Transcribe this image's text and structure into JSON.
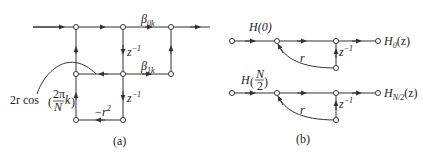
{
  "diagram_a": {
    "caption": "(a)",
    "labels": {
      "beta0": "β",
      "beta0_sub": "0k",
      "beta1": "β",
      "beta1_sub": "1k",
      "zinv1": "z",
      "zinv1_sup": "−1",
      "zinv2": "z",
      "zinv2_sup": "−1",
      "neg_r2": "−r",
      "neg_r2_sup": "2",
      "coef_prefix": "2r cos",
      "coef_num": "2π",
      "coef_den": "N",
      "coef_k": "k"
    }
  },
  "diagram_b": {
    "caption": "(b)",
    "branch0": {
      "gain": "H(0)",
      "feedback": "r",
      "delay": "z",
      "delay_sup": "−1",
      "output": "H",
      "output_sub": "0",
      "output_arg": "(z)"
    },
    "branch1": {
      "gain_prefix": "H",
      "gain_num": "N",
      "gain_den": "2",
      "feedback": "r",
      "delay": "z",
      "delay_sup": "−1",
      "output": "H",
      "output_sub": "N/2",
      "output_arg": "(z)"
    }
  },
  "colors": {
    "line": "#333333",
    "node_fill": "#ffffff"
  }
}
